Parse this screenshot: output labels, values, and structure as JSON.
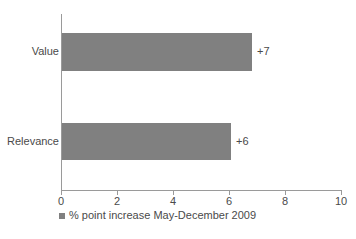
{
  "chart_data": {
    "type": "bar",
    "orientation": "horizontal",
    "title": "",
    "subtitle": "",
    "xlabel": "",
    "ylabel": "",
    "categories": [
      "Value",
      "Relevance"
    ],
    "values": [
      6.75,
      6.0
    ],
    "data_labels": [
      "+7",
      "+6"
    ],
    "series": [
      {
        "name": "% point increase May-December 2009",
        "values": [
          6.75,
          6.0
        ]
      }
    ],
    "xlim": [
      0,
      10
    ],
    "x_ticks": [
      0,
      2,
      4,
      6,
      8,
      10
    ],
    "x_tick_labels": [
      "0",
      "2",
      "4",
      "6",
      "8",
      "10"
    ],
    "grid": false,
    "legend": {
      "position": "bottom-left",
      "entries": [
        {
          "label": "% point increase May-December 2009",
          "color": "#808080"
        }
      ]
    },
    "colors": {
      "bar": "#808080",
      "axis": "#9a9a9a",
      "text": "#4a4a4a",
      "background": "#ffffff"
    }
  },
  "axis": {
    "ticks": [
      {
        "label": "0"
      },
      {
        "label": "2"
      },
      {
        "label": "4"
      },
      {
        "label": "6"
      },
      {
        "label": "8"
      },
      {
        "label": "10"
      }
    ]
  },
  "bars": [
    {
      "category": "Value",
      "label": "+7"
    },
    {
      "category": "Relevance",
      "label": "+6"
    }
  ],
  "legend": {
    "text": "% point increase May-December 2009"
  }
}
